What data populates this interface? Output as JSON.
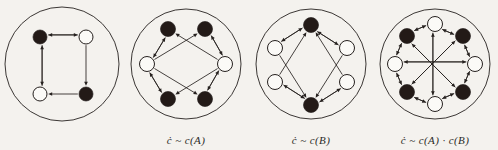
{
  "figure": {
    "background_color": "#f4f2ee",
    "ink_color": "#26211f",
    "node_black_color": "#231a17",
    "node_white_color": "#fbfaf7",
    "width": 498,
    "height": 150,
    "panel_count": 4
  },
  "panels": [
    {
      "id": "panel-base-graph",
      "name": "base-directed-4-cycle",
      "caption": "",
      "boundary": {
        "cx": 62,
        "cy": 62,
        "r": 57
      },
      "node_radius": 7,
      "nodes": [
        {
          "id": "n0",
          "label": "",
          "color": "black",
          "x": 40,
          "y": 35
        },
        {
          "id": "n1",
          "label": "",
          "color": "white",
          "x": 86,
          "y": 35
        },
        {
          "id": "n2",
          "label": "",
          "color": "black",
          "x": 86,
          "y": 92
        },
        {
          "id": "n3",
          "label": "",
          "color": "white",
          "x": 40,
          "y": 92
        }
      ],
      "edges": [
        {
          "from": "n1",
          "to": "n0",
          "directed": true
        },
        {
          "from": "n0",
          "to": "n1",
          "directed": true
        },
        {
          "from": "n1",
          "to": "n2",
          "directed": true
        },
        {
          "from": "n2",
          "to": "n3",
          "directed": true
        },
        {
          "from": "n3",
          "to": "n0",
          "directed": true
        },
        {
          "from": "n0",
          "to": "n3",
          "directed": true
        }
      ]
    },
    {
      "id": "panel-cover-a",
      "name": "cover-graph-a",
      "caption": "ċ ~ c(A)",
      "caption_parts": {
        "lhs": "ċ",
        "relation": "~",
        "rhs": "c(A)"
      },
      "boundary": {
        "cx": 62,
        "cy": 62,
        "r": 55
      },
      "node_radius": 7.5,
      "nodes": [
        {
          "id": "m0",
          "label": "",
          "color": "black",
          "x": 44,
          "y": 27
        },
        {
          "id": "m1",
          "label": "",
          "color": "black",
          "x": 81,
          "y": 27
        },
        {
          "id": "m2",
          "label": "",
          "color": "white",
          "x": 101,
          "y": 62
        },
        {
          "id": "m3",
          "label": "",
          "color": "black",
          "x": 81,
          "y": 97
        },
        {
          "id": "m4",
          "label": "",
          "color": "black",
          "x": 44,
          "y": 97
        },
        {
          "id": "m5",
          "label": "",
          "color": "white",
          "x": 23,
          "y": 62
        }
      ],
      "edges": [
        {
          "from": "m5",
          "to": "m0",
          "directed": true
        },
        {
          "from": "m0",
          "to": "m5",
          "directed": true
        },
        {
          "from": "m5",
          "to": "m1",
          "directed": true
        },
        {
          "from": "m2",
          "to": "m0",
          "directed": true
        },
        {
          "from": "m2",
          "to": "m1",
          "directed": true
        },
        {
          "from": "m1",
          "to": "m2",
          "directed": true
        },
        {
          "from": "m5",
          "to": "m4",
          "directed": true
        },
        {
          "from": "m4",
          "to": "m5",
          "directed": true
        },
        {
          "from": "m5",
          "to": "m3",
          "directed": true
        },
        {
          "from": "m2",
          "to": "m4",
          "directed": true
        },
        {
          "from": "m2",
          "to": "m3",
          "directed": true
        },
        {
          "from": "m3",
          "to": "m2",
          "directed": true
        }
      ]
    },
    {
      "id": "panel-cover-b",
      "name": "cover-graph-b",
      "caption": "ċ ~ c(B)",
      "caption_parts": {
        "lhs": "ċ",
        "relation": "~",
        "rhs": "c(B)"
      },
      "boundary": {
        "cx": 62,
        "cy": 62,
        "r": 55
      },
      "node_radius": 7.5,
      "nodes": [
        {
          "id": "k0",
          "label": "",
          "color": "black",
          "x": 62,
          "y": 23
        },
        {
          "id": "k1",
          "label": "",
          "color": "white",
          "x": 98,
          "y": 46
        },
        {
          "id": "k2",
          "label": "",
          "color": "white",
          "x": 98,
          "y": 80
        },
        {
          "id": "k3",
          "label": "",
          "color": "black",
          "x": 62,
          "y": 103
        },
        {
          "id": "k4",
          "label": "",
          "color": "white",
          "x": 26,
          "y": 80
        },
        {
          "id": "k5",
          "label": "",
          "color": "white",
          "x": 26,
          "y": 46
        }
      ],
      "edges": [
        {
          "from": "k0",
          "to": "k5",
          "directed": true
        },
        {
          "from": "k5",
          "to": "k0",
          "directed": true
        },
        {
          "from": "k0",
          "to": "k1",
          "directed": true
        },
        {
          "from": "k1",
          "to": "k0",
          "directed": true
        },
        {
          "from": "k4",
          "to": "k0",
          "directed": true
        },
        {
          "from": "k2",
          "to": "k0",
          "directed": true
        },
        {
          "from": "k3",
          "to": "k4",
          "directed": true
        },
        {
          "from": "k4",
          "to": "k3",
          "directed": true
        },
        {
          "from": "k3",
          "to": "k2",
          "directed": true
        },
        {
          "from": "k2",
          "to": "k3",
          "directed": true
        },
        {
          "from": "k5",
          "to": "k3",
          "directed": true
        },
        {
          "from": "k1",
          "to": "k3",
          "directed": true
        }
      ]
    },
    {
      "id": "panel-cover-ab",
      "name": "cover-graph-a-times-b",
      "caption": "ċ ~ c(A) · c(B)",
      "caption_parts": {
        "lhs": "ċ",
        "relation": "~",
        "rhs": "c(A) · c(B)"
      },
      "boundary": {
        "cx": 62,
        "cy": 62,
        "r": 55
      },
      "node_radius": 7.5,
      "nodes": [
        {
          "id": "p0",
          "label": "",
          "color": "white",
          "x": 62,
          "y": 22
        },
        {
          "id": "p1",
          "label": "",
          "color": "black",
          "x": 90,
          "y": 34
        },
        {
          "id": "p2",
          "label": "",
          "color": "white",
          "x": 102,
          "y": 62
        },
        {
          "id": "p3",
          "label": "",
          "color": "black",
          "x": 90,
          "y": 90
        },
        {
          "id": "p4",
          "label": "",
          "color": "white",
          "x": 62,
          "y": 102
        },
        {
          "id": "p5",
          "label": "",
          "color": "black",
          "x": 34,
          "y": 90
        },
        {
          "id": "p6",
          "label": "",
          "color": "white",
          "x": 22,
          "y": 62
        },
        {
          "id": "p7",
          "label": "",
          "color": "black",
          "x": 34,
          "y": 34
        }
      ],
      "edges": [
        {
          "from": "p0",
          "to": "p7",
          "directed": true
        },
        {
          "from": "p7",
          "to": "p0",
          "directed": true
        },
        {
          "from": "p0",
          "to": "p1",
          "directed": true
        },
        {
          "from": "p1",
          "to": "p0",
          "directed": true
        },
        {
          "from": "p7",
          "to": "p6",
          "directed": true
        },
        {
          "from": "p6",
          "to": "p7",
          "directed": true
        },
        {
          "from": "p1",
          "to": "p2",
          "directed": true
        },
        {
          "from": "p2",
          "to": "p1",
          "directed": true
        },
        {
          "from": "p6",
          "to": "p5",
          "directed": true
        },
        {
          "from": "p5",
          "to": "p6",
          "directed": true
        },
        {
          "from": "p2",
          "to": "p3",
          "directed": true
        },
        {
          "from": "p3",
          "to": "p2",
          "directed": true
        },
        {
          "from": "p5",
          "to": "p4",
          "directed": true
        },
        {
          "from": "p4",
          "to": "p5",
          "directed": true
        },
        {
          "from": "p3",
          "to": "p4",
          "directed": true
        },
        {
          "from": "p4",
          "to": "p3",
          "directed": true
        },
        {
          "from": "p7",
          "to": "p3",
          "directed": true
        },
        {
          "from": "p3",
          "to": "p7",
          "directed": true
        },
        {
          "from": "p1",
          "to": "p5",
          "directed": true
        },
        {
          "from": "p5",
          "to": "p1",
          "directed": true
        },
        {
          "from": "p0",
          "to": "p4",
          "directed": true
        },
        {
          "from": "p4",
          "to": "p0",
          "directed": true
        },
        {
          "from": "p2",
          "to": "p6",
          "directed": true
        },
        {
          "from": "p6",
          "to": "p2",
          "directed": true
        }
      ]
    }
  ]
}
